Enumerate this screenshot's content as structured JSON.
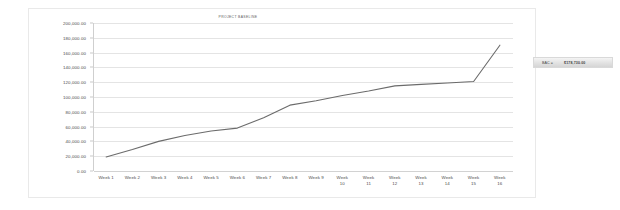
{
  "chart": {
    "title": "PROJECT BASELINE"
  },
  "callout": {
    "label": "BAC =",
    "value": "$178,730.00"
  },
  "chart_data": {
    "type": "line",
    "title": "PROJECT BASELINE",
    "xlabel": "",
    "ylabel": "",
    "grid": true,
    "legend": false,
    "ylim": [
      0,
      200000
    ],
    "ytick_labels": [
      "200,000.00",
      "180,000.00",
      "160,000.00",
      "140,000.00",
      "120,000.00",
      "100,000.00",
      "80,000.00",
      "60,000.00",
      "40,000.00",
      "20,000.00",
      "0.00"
    ],
    "ytick_values": [
      200000,
      180000,
      160000,
      140000,
      120000,
      100000,
      80000,
      60000,
      40000,
      20000,
      0
    ],
    "categories": [
      "Week 1",
      "Week 2",
      "Week 3",
      "Week 4",
      "Week 5",
      "Week 6",
      "Week 7",
      "Week 8",
      "Week 9",
      "Week 10",
      "Week 11",
      "Week 12",
      "Week 13",
      "Week 14",
      "Week 15",
      "Week 16"
    ],
    "series": [
      {
        "name": "Cumulative Planned Value",
        "color": "#6b6b6b",
        "values": [
          19000,
          29000,
          40000,
          48000,
          54000,
          58000,
          72000,
          89000,
          95000,
          102000,
          108000,
          115000,
          117000,
          119000,
          121000,
          170000
        ]
      }
    ]
  }
}
